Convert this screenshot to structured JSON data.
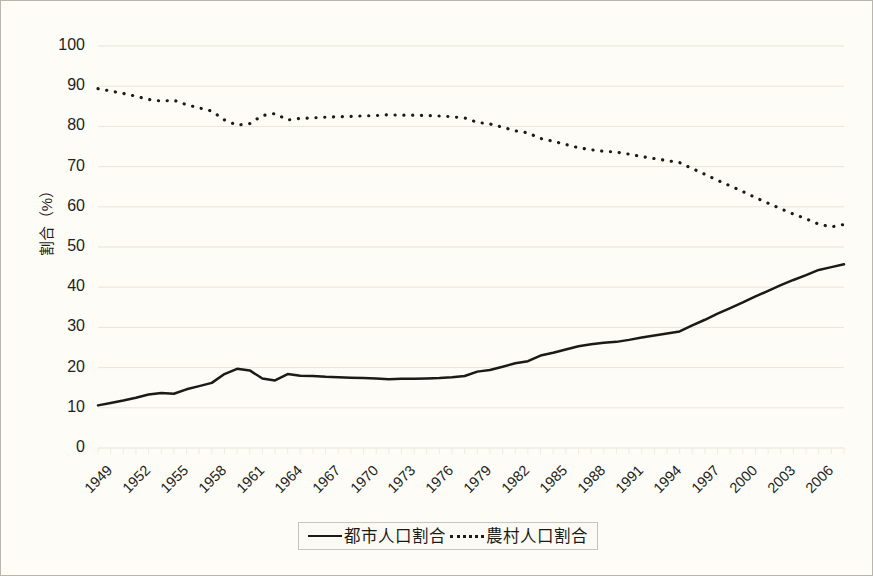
{
  "chart_data": {
    "type": "line",
    "title": "",
    "xlabel": "",
    "ylabel": "割合（%）",
    "ylim": [
      0,
      100
    ],
    "ytick_values": [
      100,
      90,
      80,
      70,
      60,
      50,
      40,
      30,
      20,
      10,
      0
    ],
    "grid": true,
    "grid_axis": "y",
    "legend_position": "bottom-center",
    "x_tick_labels": [
      "1949",
      "1952",
      "1955",
      "1958",
      "1961",
      "1964",
      "1967",
      "1970",
      "1973",
      "1976",
      "1979",
      "1982",
      "1985",
      "1988",
      "1991",
      "1994",
      "1997",
      "2000",
      "2003",
      "2006"
    ],
    "x_tick_step": 3,
    "x": [
      1949,
      1950,
      1951,
      1952,
      1953,
      1954,
      1955,
      1956,
      1957,
      1958,
      1959,
      1960,
      1961,
      1962,
      1963,
      1964,
      1965,
      1966,
      1967,
      1968,
      1969,
      1970,
      1971,
      1972,
      1973,
      1974,
      1975,
      1976,
      1977,
      1978,
      1979,
      1980,
      1981,
      1982,
      1983,
      1984,
      1985,
      1986,
      1987,
      1988,
      1989,
      1990,
      1991,
      1992,
      1993,
      1994,
      1995,
      1996,
      1997,
      1998,
      1999,
      2000,
      2001,
      2002,
      2003,
      2004,
      2005,
      2006,
      2007,
      2008
    ],
    "series": [
      {
        "name": "都市人口割合",
        "style": "solid",
        "color": "#1c1a17",
        "values": [
          10.6,
          11.2,
          11.8,
          12.5,
          13.3,
          13.7,
          13.5,
          14.6,
          15.4,
          16.2,
          18.4,
          19.7,
          19.3,
          17.3,
          16.8,
          18.4,
          18.0,
          17.9,
          17.7,
          17.6,
          17.5,
          17.4,
          17.3,
          17.1,
          17.2,
          17.2,
          17.3,
          17.4,
          17.6,
          17.9,
          19.0,
          19.4,
          20.2,
          21.1,
          21.6,
          23.0,
          23.7,
          24.5,
          25.3,
          25.8,
          26.2,
          26.4,
          26.9,
          27.5,
          28.0,
          28.5,
          29.0,
          30.5,
          31.9,
          33.4,
          34.8,
          36.2,
          37.7,
          39.1,
          40.5,
          41.8,
          43.0,
          44.3,
          45.0,
          45.7
        ]
      },
      {
        "name": "農村人口割合",
        "style": "dotted",
        "color": "#1c1a17",
        "values": [
          89.4,
          88.8,
          88.2,
          87.5,
          86.7,
          86.3,
          86.5,
          85.4,
          84.6,
          83.8,
          81.6,
          80.3,
          80.7,
          82.7,
          83.2,
          81.6,
          82.0,
          82.1,
          82.3,
          82.4,
          82.5,
          82.6,
          82.7,
          82.9,
          82.8,
          82.8,
          82.7,
          82.6,
          82.4,
          82.1,
          81.0,
          80.6,
          79.8,
          78.9,
          78.4,
          77.0,
          76.3,
          75.5,
          74.7,
          74.2,
          73.8,
          73.6,
          73.1,
          72.5,
          72.0,
          71.5,
          71.0,
          69.5,
          68.1,
          66.6,
          65.2,
          63.8,
          62.3,
          60.9,
          59.5,
          58.2,
          57.0,
          55.7,
          55.0,
          55.6
        ]
      }
    ]
  },
  "axes": {
    "y_label": "割合（%）",
    "y_ticks": [
      "100",
      "90",
      "80",
      "70",
      "60",
      "50",
      "40",
      "30",
      "20",
      "10",
      "0"
    ],
    "x_ticks": [
      "1949",
      "1952",
      "1955",
      "1958",
      "1961",
      "1964",
      "1967",
      "1970",
      "1973",
      "1976",
      "1979",
      "1982",
      "1985",
      "1988",
      "1991",
      "1994",
      "1997",
      "2000",
      "2003",
      "2006"
    ]
  },
  "legend": {
    "items": [
      {
        "label": "都市人口割合",
        "style": "solid"
      },
      {
        "label": "農村人口割合",
        "style": "dotted"
      }
    ]
  },
  "colors": {
    "line": "#1c1a17",
    "grid": "#e8e5da",
    "background": "#fdfcf7",
    "frame": "#b9b7ad",
    "text": "#231f1c"
  }
}
